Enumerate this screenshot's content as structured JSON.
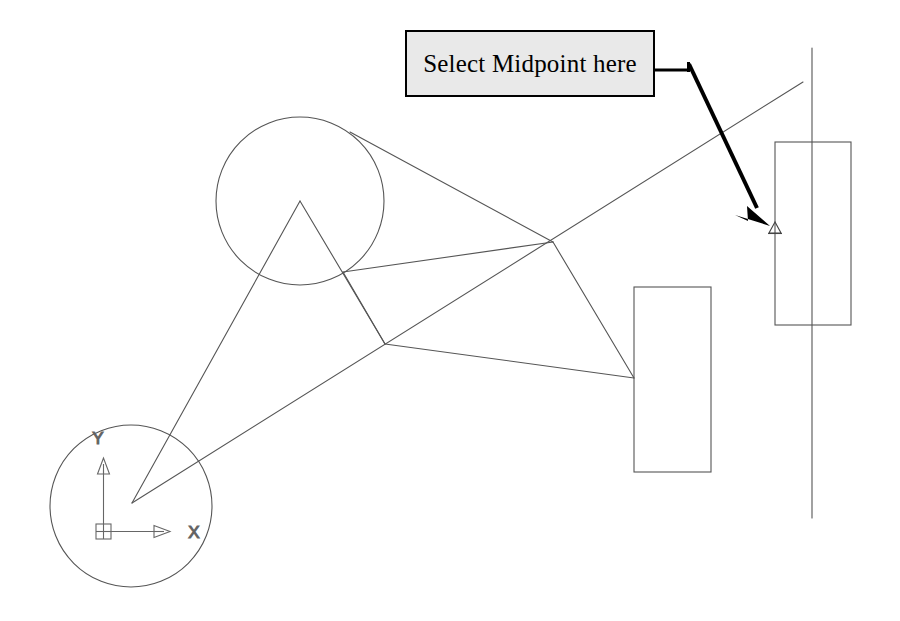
{
  "canvas": {
    "width": 900,
    "height": 621,
    "background": "#ffffff"
  },
  "callout": {
    "text": "Select Midpoint here",
    "box": {
      "x": 405,
      "y": 30,
      "width": 250,
      "height": 67
    },
    "fill": "#e9e9e9",
    "stroke": "#000000",
    "leader": {
      "name": "leader-arrow",
      "horizontal_from": {
        "x": 655,
        "y": 70
      },
      "horizontal_to": {
        "x": 688,
        "y": 70
      },
      "arrow_tip": {
        "x": 768,
        "y": 222
      },
      "color": "#000000"
    }
  },
  "ucs_icon": {
    "origin": {
      "x": 103,
      "y": 531
    },
    "x_axis_label": "X",
    "y_axis_label": "Y",
    "x_axis_end": {
      "x": 170,
      "y": 531
    },
    "y_axis_end": {
      "x": 103,
      "y": 458
    },
    "x_label_pos": {
      "x": 194,
      "y": 538
    },
    "y_label_pos": {
      "x": 98,
      "y": 444
    },
    "stroke": "#666666"
  },
  "osnap_marker": {
    "type": "midpoint-triangle",
    "position": {
      "x": 775,
      "y": 229
    },
    "size": 9,
    "stroke": "#444444"
  },
  "geometry": {
    "stroke": "#555555",
    "stroke_width": 1,
    "circles": [
      {
        "name": "upper-circle",
        "cx": 300,
        "cy": 201,
        "r": 84
      },
      {
        "name": "lower-left-circle",
        "cx": 131,
        "cy": 506,
        "r": 81
      }
    ],
    "rectangles": [
      {
        "name": "middle-rectangle",
        "x": 634,
        "y": 287,
        "width": 77,
        "height": 185
      },
      {
        "name": "right-rectangle",
        "x": 775,
        "y": 142,
        "width": 76,
        "height": 183
      }
    ],
    "lines": [
      {
        "name": "vertical-construction-line",
        "x1": 812,
        "y1": 48,
        "x2": 812,
        "y2": 518
      },
      {
        "name": "long-diagonal-line",
        "x1": 132,
        "y1": 503,
        "x2": 803,
        "y2": 82
      },
      {
        "name": "left-riser-line",
        "x1": 132,
        "y1": 503,
        "x2": 300,
        "y2": 201
      },
      {
        "name": "apex-to-midvertex-line",
        "x1": 300,
        "y1": 201,
        "x2": 385,
        "y2": 344
      },
      {
        "name": "circle-to-crossvertex-line",
        "x1": 350,
        "y1": 132,
        "x2": 553,
        "y2": 242
      },
      {
        "name": "crossvertex-to-rect-line",
        "x1": 553,
        "y1": 242,
        "x2": 634,
        "y2": 378
      },
      {
        "name": "midvertex-to-rect-line",
        "x1": 385,
        "y1": 344,
        "x2": 634,
        "y2": 378
      },
      {
        "name": "upper-short-chord-line",
        "x1": 343,
        "y1": 272,
        "x2": 553,
        "y2": 242
      },
      {
        "name": "upper-chord-to-crossvertex-line",
        "x1": 343,
        "y1": 272,
        "x2": 470,
        "y2": 292
      },
      {
        "name": "lower-left-branch-line",
        "x1": 343,
        "y1": 272,
        "x2": 385,
        "y2": 344
      },
      {
        "name": "midvertex-down-left-line",
        "x1": 385,
        "y1": 344,
        "x2": 340,
        "y2": 420
      },
      {
        "name": "apex-down-left-line",
        "x1": 300,
        "y1": 201,
        "x2": 245,
        "y2": 295
      }
    ]
  }
}
